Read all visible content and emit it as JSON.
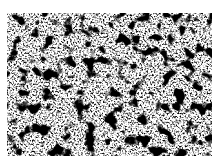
{
  "image": {
    "kind": "micrograph",
    "description": "Black and white grainy microstructure texture with dark particles scattered over a light granular matrix",
    "colors": {
      "dark": "#000000",
      "light": "#ffffff"
    }
  }
}
